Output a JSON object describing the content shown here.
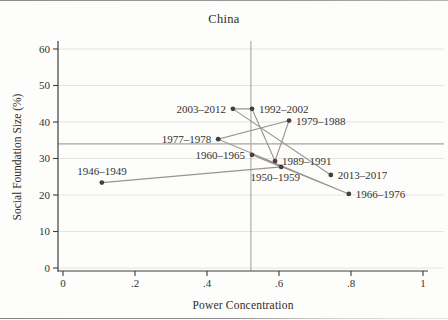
{
  "chart_data": {
    "type": "scatter",
    "connected": true,
    "title": "China",
    "xlabel": "Power Concentration",
    "ylabel": "Social Foundation Size (%)",
    "xlim": [
      0,
      1
    ],
    "ylim": [
      0,
      60
    ],
    "x_ticks": {
      "values": [
        0,
        0.2,
        0.4,
        0.6,
        0.8,
        1
      ],
      "labels": [
        "0",
        ".2",
        ".4",
        ".6",
        ".8",
        "1"
      ]
    },
    "y_ticks": {
      "values": [
        0,
        10,
        20,
        30,
        40,
        50,
        60
      ],
      "labels": [
        "0",
        "10",
        "20",
        "30",
        "40",
        "50",
        "60"
      ]
    },
    "grid": "horizontal",
    "legend": "none",
    "reference_lines": {
      "x": 0.522,
      "y": 34
    },
    "points": [
      {
        "label": "1946–1949",
        "x": 0.108,
        "y": 23.4,
        "label_pos": "above"
      },
      {
        "label": "1950–1959",
        "x": 0.606,
        "y": 27.7,
        "label_pos": "below"
      },
      {
        "label": "1960–1965",
        "x": 0.525,
        "y": 31.0,
        "label_pos": "left"
      },
      {
        "label": "1966–1976",
        "x": 0.794,
        "y": 20.3,
        "label_pos": "right"
      },
      {
        "label": "1977–1978",
        "x": 0.431,
        "y": 35.3,
        "label_pos": "left"
      },
      {
        "label": "1979–1988",
        "x": 0.628,
        "y": 40.4,
        "label_pos": "right"
      },
      {
        "label": "1989–1991",
        "x": 0.589,
        "y": 29.3,
        "label_pos": "right"
      },
      {
        "label": "1992–2002",
        "x": 0.525,
        "y": 43.6,
        "label_pos": "right"
      },
      {
        "label": "2003–2012",
        "x": 0.472,
        "y": 43.6,
        "label_pos": "left"
      },
      {
        "label": "2013–2017",
        "x": 0.744,
        "y": 25.5,
        "label_pos": "right"
      }
    ],
    "colors": {
      "point": "#45403c",
      "line": "#9a948e",
      "reference": "#aaa69f",
      "grid": "#e6e4e0",
      "axis": "#3f3d3a",
      "text": "#35322f"
    }
  }
}
